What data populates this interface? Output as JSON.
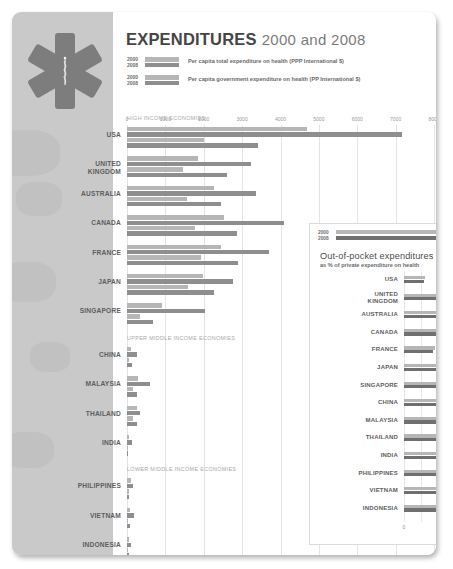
{
  "header": {
    "title_main": "EXPENDITURES",
    "title_years": "2000 and 2008",
    "logo_name": "star-of-life-logo"
  },
  "legend": [
    {
      "year_a": "2000",
      "year_b": "2008",
      "text": "Per capita total expenditure on health (PPP International $)",
      "color_a": "#b6b6b6",
      "color_b": "#8e8e8e"
    },
    {
      "year_a": "2000",
      "year_b": "2008",
      "text": "Per capita government expenditure on health (PP International $)",
      "color_a": "#b6b6b6",
      "color_b": "#8e8e8e"
    }
  ],
  "sections": [
    {
      "id": "high",
      "label": "HIGH INCOME ECONOMIES"
    },
    {
      "id": "upper",
      "label": "UPPER MIDDLE INCOME ECONOMIES"
    },
    {
      "id": "lower",
      "label": "LOWER MIDDLE INCOME ECONOMIES"
    }
  ],
  "axis": {
    "ticks": [
      "0",
      "1000",
      "2000",
      "3000",
      "4000",
      "5000",
      "6000",
      "7000",
      "8000"
    ],
    "min": 0,
    "max": 8000
  },
  "inset": {
    "title": "Out-of-pocket expenditures",
    "subtitle": "as % of private expenditure on health",
    "legend": {
      "year_a": "2000",
      "year_b": "2008",
      "color_a": "#b6b6b6",
      "color_b": "#6f6f6f"
    },
    "axis_ticks": [
      "0",
      "40",
      "80",
      "120"
    ],
    "axis_min": 0,
    "axis_max": 120,
    "source": "Source: WHO [8]"
  },
  "chart_data": [
    {
      "type": "bar",
      "title": "EXPENDITURES 2000 and 2008",
      "xlabel": "PPP International $",
      "ylabel": "",
      "xlim": [
        0,
        8000
      ],
      "grid": true,
      "legend_position": "top",
      "orientation": "horizontal",
      "categories": [
        "USA",
        "UNITED KINGDOM",
        "AUSTRALIA",
        "CANADA",
        "FRANCE",
        "JAPAN",
        "SINGAPORE",
        "CHINA",
        "MALAYSIA",
        "THAILAND",
        "INDIA",
        "PHILIPPINES",
        "VIETNAM",
        "INDONESIA"
      ],
      "groups": [
        "HIGH INCOME ECONOMIES",
        "HIGH INCOME ECONOMIES",
        "HIGH INCOME ECONOMIES",
        "HIGH INCOME ECONOMIES",
        "HIGH INCOME ECONOMIES",
        "HIGH INCOME ECONOMIES",
        "HIGH INCOME ECONOMIES",
        "UPPER MIDDLE INCOME ECONOMIES",
        "UPPER MIDDLE INCOME ECONOMIES",
        "UPPER MIDDLE INCOME ECONOMIES",
        "UPPER MIDDLE INCOME ECONOMIES",
        "LOWER MIDDLE INCOME ECONOMIES",
        "LOWER MIDDLE INCOME ECONOMIES",
        "LOWER MIDDLE INCOME ECONOMIES"
      ],
      "series": [
        {
          "name": "Per capita total expenditure on health 2000",
          "color": "#b6b6b6",
          "values": [
            4703,
            1847,
            2267,
            2519,
            2456,
            1971,
            911,
            108,
            293,
            257,
            63,
            112,
            79,
            61
          ]
        },
        {
          "name": "Per capita total expenditure on health 2008",
          "color": "#8e8e8e",
          "values": [
            7164,
            3230,
            3365,
            4079,
            3696,
            2751,
            2022,
            265,
            604,
            345,
            122,
            155,
            192,
            92
          ]
        },
        {
          "name": "Per capita government expenditure on health 2000",
          "color": "#b6b6b6",
          "values": [
            2016,
            1467,
            1555,
            1779,
            1936,
            1590,
            350,
            41,
            160,
            145,
            16,
            53,
            23,
            22
          ]
        },
        {
          "name": "Per capita government expenditure on health 2008",
          "color": "#8e8e8e",
          "values": [
            3425,
            2617,
            2437,
            2872,
            2902,
            2275,
            670,
            121,
            271,
            260,
            38,
            54,
            74,
            48
          ]
        }
      ]
    },
    {
      "type": "bar",
      "title": "Out-of-pocket expenditures",
      "subtitle": "as % of private expenditure on health",
      "xlabel": "%",
      "ylabel": "",
      "xlim": [
        0,
        120
      ],
      "grid": true,
      "orientation": "horizontal",
      "categories": [
        "USA",
        "UNITED KINGDOM",
        "AUSTRALIA",
        "CANADA",
        "FRANCE",
        "JAPAN",
        "SINGAPORE",
        "CHINA",
        "MALAYSIA",
        "THAILAND",
        "INDIA",
        "PHILIPPINES",
        "VIETNAM",
        "INDONESIA"
      ],
      "series": [
        {
          "name": "2000",
          "color": "#b6b6b6",
          "values": [
            24,
            56,
            59,
            51,
            36,
            89,
            97,
            96,
            78,
            81,
            95,
            83,
            95,
            74
          ]
        },
        {
          "name": "2008",
          "color": "#6f6f6f",
          "values": [
            23,
            55,
            58,
            46,
            33,
            81,
            94,
            80,
            74,
            70,
            74,
            78,
            88,
            69
          ]
        }
      ]
    }
  ]
}
